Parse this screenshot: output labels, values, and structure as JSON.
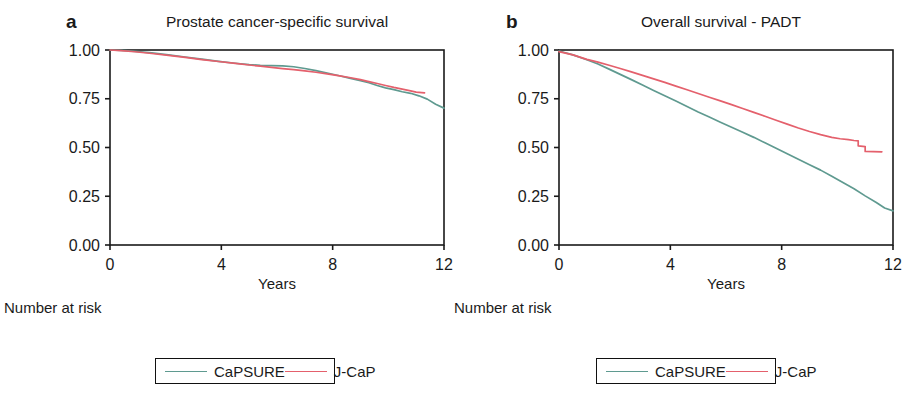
{
  "figure": {
    "background": "#ffffff",
    "axis_color": "#1a1a1a"
  },
  "colors": {
    "capsure": "#5f9a90",
    "jcap": "#e4606c",
    "text": "#1a1a1a"
  },
  "panels": [
    {
      "letter": "a",
      "title": "Prostate cancer-specific survival",
      "axes": {
        "xlabel": "Years",
        "xticks": [
          "0",
          "4",
          "8",
          "12"
        ],
        "xtick_values": [
          0,
          4,
          8,
          12
        ],
        "yticks": [
          "0.00",
          "0.25",
          "0.50",
          "0.75",
          "1.00"
        ],
        "ytick_values": [
          0.0,
          0.25,
          0.5,
          0.75,
          1.0
        ],
        "xlim": [
          0,
          12
        ],
        "ylim": [
          0,
          1
        ],
        "grid": false
      },
      "risk_table": {
        "title": "Number at risk",
        "rows": [
          {
            "label": "CaPSURE",
            "values": [
              "1633",
              "866",
              "309",
              "81"
            ]
          },
          {
            "label": "J-CaP",
            "values": [
              "13880",
              "5306",
              "1420",
              "0"
            ]
          }
        ]
      },
      "legend": {
        "position": "bottom-center",
        "entries": [
          {
            "label": "CaPSURE",
            "color": "#5f9a90"
          },
          {
            "label": "J-CaP",
            "color": "#e4606c"
          }
        ]
      }
    },
    {
      "letter": "b",
      "title": "Overall survival - PADT",
      "axes": {
        "xlabel": "Years",
        "xticks": [
          "0",
          "4",
          "8",
          "12"
        ],
        "xtick_values": [
          0,
          4,
          8,
          12
        ],
        "yticks": [
          "0.00",
          "0.25",
          "0.50",
          "0.75",
          "1.00"
        ],
        "ytick_values": [
          0.0,
          0.25,
          0.5,
          0.75,
          1.0
        ],
        "xlim": [
          0,
          12
        ],
        "ylim": [
          0,
          1
        ],
        "grid": false
      },
      "risk_table": {
        "title": "Number at risk",
        "rows": [
          {
            "label": "CaPSURE",
            "values": [
              "1633",
              "866",
              "309",
              "81"
            ]
          },
          {
            "label": "J-CaP",
            "values": [
              "13880",
              "5306",
              "1420",
              "0"
            ]
          }
        ]
      },
      "legend": {
        "position": "bottom-center",
        "entries": [
          {
            "label": "CaPSURE",
            "color": "#5f9a90"
          },
          {
            "label": "J-CaP",
            "color": "#e4606c"
          }
        ]
      }
    }
  ],
  "chart_data": [
    {
      "type": "line",
      "title": "Prostate cancer-specific survival",
      "subtitle": "a",
      "xlabel": "Years",
      "ylabel": "",
      "xlim": [
        0,
        12
      ],
      "ylim": [
        0,
        1
      ],
      "xticks": [
        0,
        4,
        8,
        12
      ],
      "yticks": [
        0,
        0.25,
        0.5,
        0.75,
        1.0
      ],
      "grid": false,
      "legend_position": "bottom-center",
      "series": [
        {
          "name": "CaPSURE",
          "color": "#5f9a90",
          "x": [
            0,
            0.4,
            0.9,
            1.5,
            2.1,
            2.7,
            3.3,
            3.9,
            4.5,
            5.0,
            5.4,
            5.8,
            6.2,
            6.6,
            7.0,
            7.4,
            7.8,
            8.2,
            8.6,
            9.0,
            9.3,
            9.6,
            9.9,
            10.2,
            10.5,
            10.8,
            11.1,
            11.4,
            11.7,
            12.0
          ],
          "y": [
            1.0,
            0.998,
            0.993,
            0.985,
            0.975,
            0.964,
            0.953,
            0.942,
            0.932,
            0.925,
            0.921,
            0.92,
            0.919,
            0.914,
            0.905,
            0.894,
            0.882,
            0.869,
            0.856,
            0.843,
            0.832,
            0.818,
            0.806,
            0.797,
            0.786,
            0.778,
            0.765,
            0.748,
            0.722,
            0.702
          ]
        },
        {
          "name": "J-CaP",
          "color": "#e4606c",
          "x": [
            0,
            0.4,
            0.9,
            1.5,
            2.1,
            2.7,
            3.3,
            3.9,
            4.5,
            5.0,
            5.4,
            5.8,
            6.2,
            6.6,
            7.0,
            7.4,
            7.8,
            8.2,
            8.6,
            9.0,
            9.3,
            9.6,
            9.9,
            10.2,
            10.5,
            10.8,
            11.0,
            11.3
          ],
          "y": [
            1.0,
            0.997,
            0.991,
            0.982,
            0.972,
            0.962,
            0.951,
            0.941,
            0.931,
            0.923,
            0.917,
            0.911,
            0.905,
            0.899,
            0.893,
            0.886,
            0.878,
            0.869,
            0.859,
            0.848,
            0.838,
            0.828,
            0.818,
            0.808,
            0.799,
            0.79,
            0.784,
            0.78
          ]
        }
      ]
    },
    {
      "type": "line",
      "title": "Overall survival - PADT",
      "subtitle": "b",
      "xlabel": "Years",
      "ylabel": "",
      "xlim": [
        0,
        12
      ],
      "ylim": [
        0,
        1
      ],
      "xticks": [
        0,
        4,
        8,
        12
      ],
      "yticks": [
        0,
        0.25,
        0.5,
        0.75,
        1.0
      ],
      "grid": false,
      "legend_position": "bottom-center",
      "series": [
        {
          "name": "CaPSURE",
          "color": "#5f9a90",
          "x": [
            0,
            0.5,
            1.0,
            1.4,
            1.8,
            2.2,
            2.6,
            3.0,
            3.4,
            3.8,
            4.2,
            4.6,
            5.0,
            5.4,
            5.8,
            6.2,
            6.6,
            7.0,
            7.4,
            7.8,
            8.2,
            8.6,
            9.0,
            9.4,
            9.8,
            10.2,
            10.6,
            11.0,
            11.4,
            11.7,
            12.0
          ],
          "y": [
            0.995,
            0.975,
            0.95,
            0.928,
            0.902,
            0.875,
            0.848,
            0.82,
            0.792,
            0.765,
            0.738,
            0.71,
            0.682,
            0.656,
            0.63,
            0.604,
            0.578,
            0.552,
            0.524,
            0.496,
            0.468,
            0.44,
            0.412,
            0.384,
            0.352,
            0.32,
            0.288,
            0.252,
            0.218,
            0.19,
            0.175
          ]
        },
        {
          "name": "J-CaP",
          "color": "#e4606c",
          "x": [
            0,
            0.5,
            1.0,
            1.4,
            1.8,
            2.2,
            2.6,
            3.0,
            3.4,
            3.8,
            4.2,
            4.6,
            5.0,
            5.4,
            5.8,
            6.2,
            6.6,
            7.0,
            7.4,
            7.8,
            8.2,
            8.6,
            9.0,
            9.4,
            9.8,
            10.1,
            10.4,
            10.6,
            10.75,
            10.75,
            11.0,
            11.0,
            11.6
          ],
          "y": [
            0.992,
            0.975,
            0.952,
            0.938,
            0.922,
            0.905,
            0.888,
            0.87,
            0.852,
            0.834,
            0.815,
            0.796,
            0.777,
            0.758,
            0.739,
            0.72,
            0.7,
            0.68,
            0.66,
            0.64,
            0.62,
            0.6,
            0.582,
            0.566,
            0.552,
            0.545,
            0.54,
            0.536,
            0.534,
            0.508,
            0.505,
            0.48,
            0.478
          ]
        }
      ]
    }
  ]
}
